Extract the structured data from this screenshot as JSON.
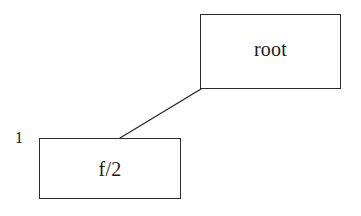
{
  "diagram": {
    "background_color": "#ffffff",
    "stroke_color": "#2b2b2b",
    "text_color": "#1a1a1a",
    "nodes": [
      {
        "id": "root",
        "label": "root",
        "x": 200,
        "y": 14,
        "width": 141,
        "height": 75
      },
      {
        "id": "child",
        "label": "f/2",
        "x": 39,
        "y": 138,
        "width": 142,
        "height": 61
      }
    ],
    "edges": [
      {
        "id": "root-to-child",
        "from": "root",
        "to": "child",
        "x1": 201,
        "y1": 89,
        "x2": 120,
        "y2": 138
      }
    ],
    "annotations": [
      {
        "id": "one",
        "label": "1",
        "x": 15,
        "y": 130
      }
    ]
  }
}
